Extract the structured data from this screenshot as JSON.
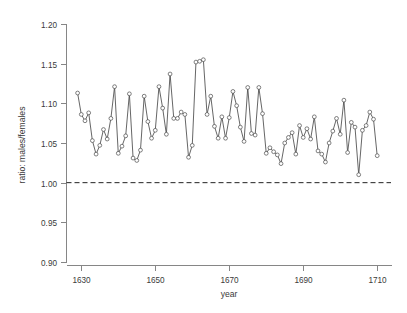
{
  "chart_data": {
    "type": "line",
    "title": "",
    "subtitle": "",
    "xlabel": "year",
    "ylabel": "ratio: males/females",
    "xlim": [
      1626,
      1714
    ],
    "ylim": [
      0.9,
      1.2
    ],
    "xticks": [
      1630,
      1650,
      1670,
      1690,
      1710
    ],
    "xtick_labels": [
      "1630",
      "1650",
      "1670",
      "1690",
      "1710"
    ],
    "yticks": [
      0.9,
      0.95,
      1.0,
      1.05,
      1.1,
      1.15,
      1.2
    ],
    "ytick_labels": [
      "0.90",
      "0.95",
      "1.00",
      "1.05",
      "1.10",
      "1.15",
      "1.20"
    ],
    "grid": false,
    "legend": null,
    "marker": "open-circle",
    "line_color": "#4a4a4a",
    "marker_fill": "#ffffff",
    "reference_lines": [
      {
        "axis": "y",
        "value": 1.0,
        "style": "dashed",
        "color": "#222222"
      }
    ],
    "x": [
      1629,
      1630,
      1631,
      1632,
      1633,
      1634,
      1635,
      1636,
      1637,
      1638,
      1639,
      1640,
      1641,
      1642,
      1643,
      1644,
      1645,
      1646,
      1647,
      1648,
      1649,
      1650,
      1651,
      1652,
      1653,
      1654,
      1655,
      1656,
      1657,
      1658,
      1659,
      1660,
      1661,
      1662,
      1663,
      1664,
      1665,
      1666,
      1667,
      1668,
      1669,
      1670,
      1671,
      1672,
      1673,
      1674,
      1675,
      1676,
      1677,
      1678,
      1679,
      1680,
      1681,
      1682,
      1683,
      1684,
      1685,
      1686,
      1687,
      1688,
      1689,
      1690,
      1691,
      1692,
      1693,
      1694,
      1695,
      1696,
      1697,
      1698,
      1699,
      1700,
      1701,
      1702,
      1703,
      1704,
      1705,
      1706,
      1707,
      1708,
      1709,
      1710
    ],
    "values": [
      1.113,
      1.086,
      1.078,
      1.088,
      1.053,
      1.036,
      1.047,
      1.067,
      1.055,
      1.081,
      1.121,
      1.037,
      1.046,
      1.059,
      1.112,
      1.031,
      1.028,
      1.041,
      1.109,
      1.077,
      1.056,
      1.066,
      1.121,
      1.094,
      1.061,
      1.137,
      1.081,
      1.081,
      1.089,
      1.086,
      1.032,
      1.047,
      1.152,
      1.153,
      1.155,
      1.086,
      1.109,
      1.071,
      1.056,
      1.083,
      1.056,
      1.082,
      1.115,
      1.097,
      1.07,
      1.052,
      1.12,
      1.062,
      1.06,
      1.12,
      1.087,
      1.037,
      1.044,
      1.039,
      1.035,
      1.024,
      1.05,
      1.057,
      1.063,
      1.036,
      1.072,
      1.057,
      1.068,
      1.055,
      1.083,
      1.04,
      1.036,
      1.026,
      1.05,
      1.065,
      1.081,
      1.061,
      1.104,
      1.038,
      1.076,
      1.07,
      1.01,
      1.066,
      1.072,
      1.089,
      1.08,
      1.034
    ],
    "series": [
      {
        "name": "ratio: males/females",
        "values": [
          1.113,
          1.086,
          1.078,
          1.088,
          1.053,
          1.036,
          1.047,
          1.067,
          1.055,
          1.081,
          1.121,
          1.037,
          1.046,
          1.059,
          1.112,
          1.031,
          1.028,
          1.041,
          1.109,
          1.077,
          1.056,
          1.066,
          1.121,
          1.094,
          1.061,
          1.137,
          1.081,
          1.081,
          1.089,
          1.086,
          1.032,
          1.047,
          1.152,
          1.153,
          1.155,
          1.086,
          1.109,
          1.071,
          1.056,
          1.083,
          1.056,
          1.082,
          1.115,
          1.097,
          1.07,
          1.052,
          1.12,
          1.062,
          1.06,
          1.12,
          1.087,
          1.037,
          1.044,
          1.039,
          1.035,
          1.024,
          1.05,
          1.057,
          1.063,
          1.036,
          1.072,
          1.057,
          1.068,
          1.055,
          1.083,
          1.04,
          1.036,
          1.026,
          1.05,
          1.065,
          1.081,
          1.061,
          1.104,
          1.038,
          1.076,
          1.07,
          1.01,
          1.066,
          1.072,
          1.089,
          1.08,
          1.034
        ]
      }
    ]
  }
}
